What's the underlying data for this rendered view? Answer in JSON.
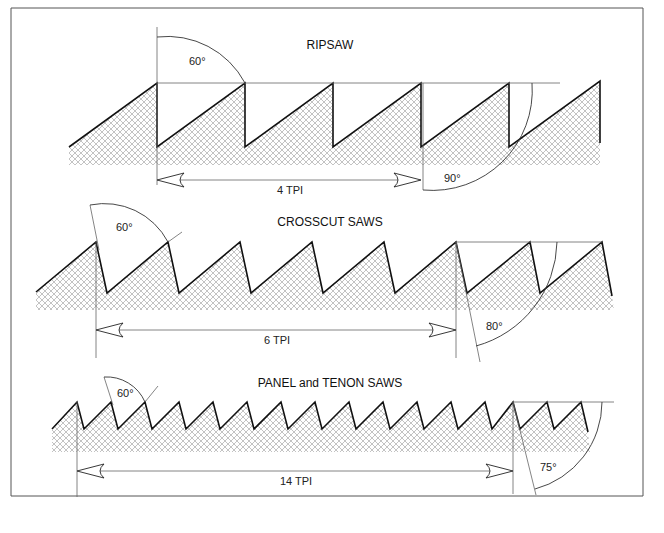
{
  "diagrams": [
    {
      "title": "RIPSAW",
      "rake_angle_label": "60°",
      "face_angle_label": "90°",
      "tpi_label": "4 TPI"
    },
    {
      "title": "CROSSCUT SAWS",
      "rake_angle_label": "60°",
      "face_angle_label": "80°",
      "tpi_label": "6 TPI"
    },
    {
      "title": "PANEL and TENON SAWS",
      "rake_angle_label": "60°",
      "face_angle_label": "75°",
      "tpi_label": "14 TPI"
    }
  ]
}
